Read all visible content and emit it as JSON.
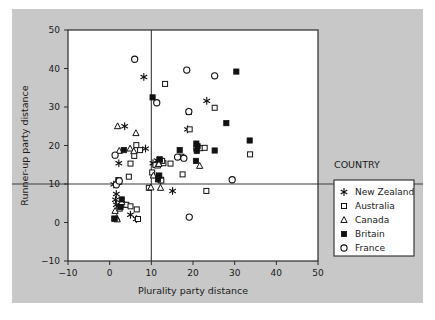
{
  "chart_data": {
    "type": "scatter",
    "title": "",
    "xlabel": "Plurality party distance",
    "ylabel": "Runner-up party distance",
    "xlim": [
      -10,
      50
    ],
    "ylim": [
      -10,
      50
    ],
    "xticks": [
      -10,
      0,
      10,
      20,
      30,
      40,
      50
    ],
    "yticks": [
      -10,
      0,
      10,
      20,
      30,
      40,
      50
    ],
    "grid": false,
    "reference_lines": [
      {
        "axis": "y",
        "value": 10
      },
      {
        "axis": "x",
        "value": 10
      }
    ],
    "legend": {
      "title": "COUNTRY",
      "position": "right-outside",
      "entries": [
        {
          "name": "New Zealand",
          "marker": "asterisk"
        },
        {
          "name": "Australia",
          "marker": "open-square-small"
        },
        {
          "name": "Canada",
          "marker": "open-triangle"
        },
        {
          "name": "Britain",
          "marker": "filled-square"
        },
        {
          "name": "France",
          "marker": "open-circle"
        }
      ]
    },
    "series": [
      {
        "name": "New Zealand",
        "marker": "asterisk",
        "points": [
          [
            3.6,
            25.0
          ],
          [
            8.2,
            37.8
          ],
          [
            6.4,
            0.9
          ],
          [
            2.2,
            15.4
          ],
          [
            1.6,
            7.4
          ],
          [
            1.4,
            5.9
          ],
          [
            1.6,
            4.6
          ],
          [
            8.6,
            19.2
          ],
          [
            11.4,
            16.1
          ],
          [
            11.8,
            15.6
          ],
          [
            11.2,
            12.0
          ],
          [
            15.1,
            8.2
          ],
          [
            18.7,
            24.2
          ],
          [
            23.3,
            31.6
          ],
          [
            10.4,
            15.4
          ],
          [
            5.0,
            2.0
          ],
          [
            12.2,
            11.0
          ],
          [
            1.0,
            9.9
          ]
        ]
      },
      {
        "name": "Australia",
        "marker": "open-square-small",
        "points": [
          [
            13.3,
            36.0
          ],
          [
            5.9,
            17.3
          ],
          [
            6.4,
            20.1
          ],
          [
            4.6,
            11.9
          ],
          [
            5.0,
            15.3
          ],
          [
            7.3,
            18.8
          ],
          [
            9.4,
            9.0
          ],
          [
            11.0,
            14.9
          ],
          [
            12.3,
            11.1
          ],
          [
            12.9,
            15.4
          ],
          [
            14.6,
            15.3
          ],
          [
            17.2,
            17.1
          ],
          [
            17.5,
            12.5
          ],
          [
            19.0,
            28.7
          ],
          [
            19.2,
            24.2
          ],
          [
            21.7,
            19.3
          ],
          [
            22.8,
            19.4
          ],
          [
            23.2,
            8.2
          ],
          [
            25.2,
            29.8
          ],
          [
            33.7,
            17.7
          ],
          [
            2.4,
            3.6
          ],
          [
            3.4,
            4.6
          ],
          [
            4.0,
            4.6
          ],
          [
            5.0,
            4.2
          ],
          [
            6.5,
            3.4
          ],
          [
            6.8,
            0.9
          ],
          [
            12.4,
            10.9
          ],
          [
            20.8,
            19.2
          ],
          [
            12.6,
            16.0
          ],
          [
            1.1,
            1.0
          ],
          [
            10.2,
            13.0
          ],
          [
            12.0,
            16.3
          ]
        ]
      },
      {
        "name": "Canada",
        "marker": "open-triangle",
        "points": [
          [
            1.9,
            25.0
          ],
          [
            6.3,
            23.2
          ],
          [
            2.3,
            18.6
          ],
          [
            4.9,
            19.2
          ],
          [
            5.8,
            18.5
          ],
          [
            11.5,
            14.8
          ],
          [
            11.8,
            15.2
          ],
          [
            9.9,
            9.1
          ],
          [
            10.5,
            12.2
          ],
          [
            21.6,
            14.7
          ],
          [
            1.3,
            3.0
          ],
          [
            1.7,
            1.2
          ],
          [
            1.8,
            0.8
          ],
          [
            2.9,
            5.3
          ],
          [
            12.2,
            9.0
          ]
        ]
      },
      {
        "name": "Britain",
        "marker": "filled-square",
        "points": [
          [
            10.3,
            32.5
          ],
          [
            30.4,
            39.2
          ],
          [
            28.0,
            25.8
          ],
          [
            33.6,
            21.3
          ],
          [
            25.2,
            18.7
          ],
          [
            21.1,
            19.8
          ],
          [
            20.9,
            18.6
          ],
          [
            20.7,
            16.0
          ],
          [
            16.8,
            18.8
          ],
          [
            12.0,
            16.4
          ],
          [
            11.9,
            12.2
          ],
          [
            3.4,
            18.8
          ],
          [
            2.1,
            11.0
          ],
          [
            2.2,
            10.6
          ],
          [
            2.9,
            6.0
          ],
          [
            2.6,
            4.0
          ],
          [
            11.6,
            11.2
          ],
          [
            1.2,
            1.0
          ],
          [
            20.8,
            20.5
          ]
        ]
      },
      {
        "name": "France",
        "marker": "open-circle",
        "points": [
          [
            6.0,
            42.4
          ],
          [
            18.5,
            39.6
          ],
          [
            25.2,
            38.1
          ],
          [
            11.3,
            31.1
          ],
          [
            19.0,
            28.8
          ],
          [
            1.3,
            17.5
          ],
          [
            17.8,
            16.7
          ],
          [
            16.3,
            17.0
          ],
          [
            29.4,
            11.1
          ],
          [
            19.1,
            1.4
          ],
          [
            1.6,
            9.8
          ],
          [
            2.3,
            10.8
          ]
        ]
      }
    ]
  }
}
